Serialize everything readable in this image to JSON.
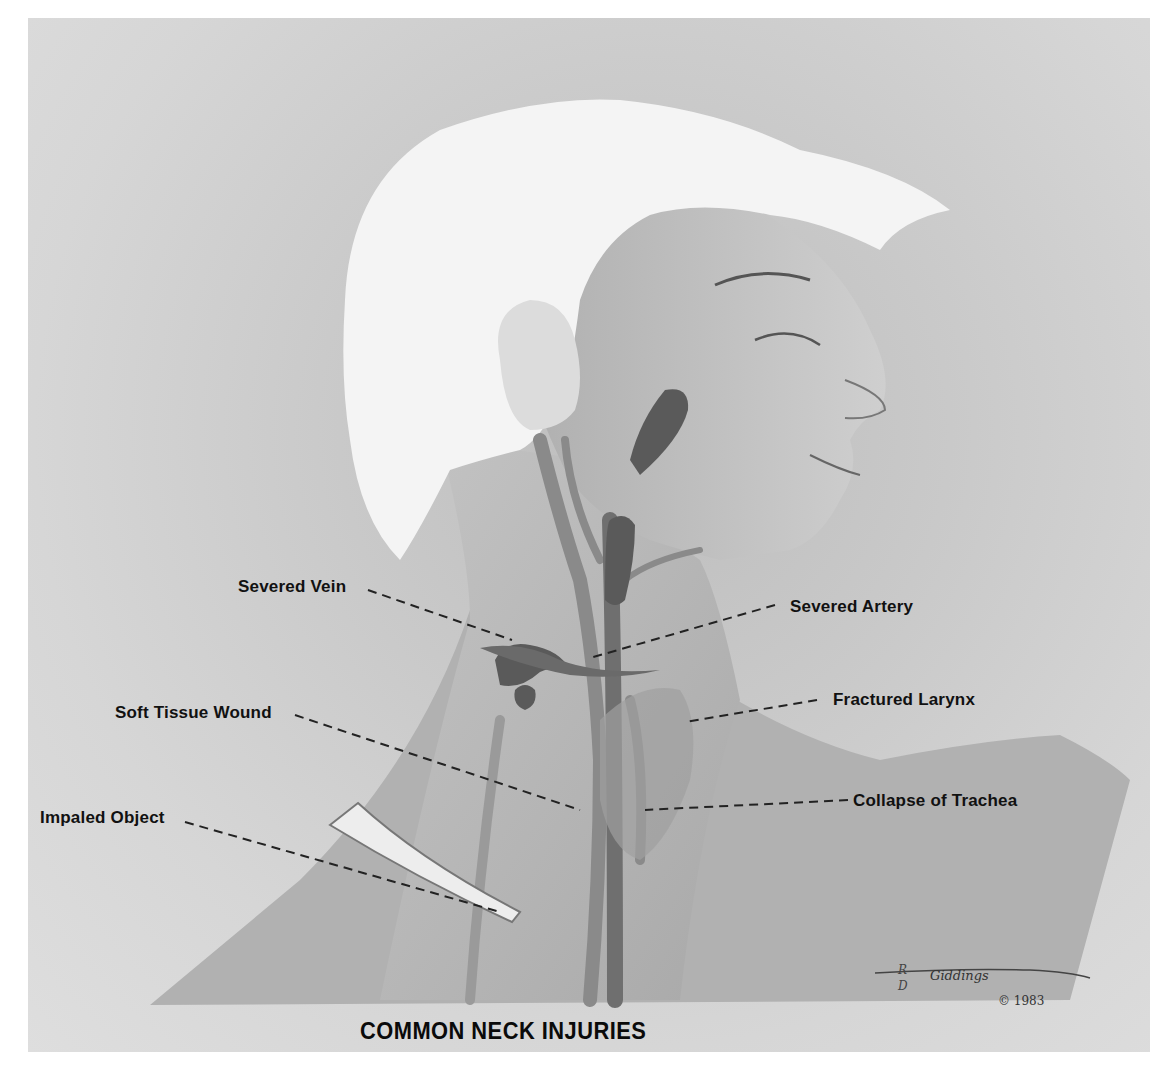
{
  "title": "COMMON NECK INJURIES",
  "labels": {
    "severed_vein": "Severed Vein",
    "severed_artery": "Severed Artery",
    "soft_tissue_wound": "Soft Tissue Wound",
    "fractured_larynx": "Fractured Larynx",
    "impaled_object": "Impaled Object",
    "collapse_of_trachea": "Collapse of Trachea"
  },
  "signature": {
    "artist": "Giddings",
    "initial_top": "R",
    "initial_bottom": "D",
    "copyright": "© 1983"
  },
  "colors": {
    "background_paper": "#d0d0d0",
    "skin": "#b8b8b8",
    "hair": "#f2f2f2",
    "blood": "#5a5a5a",
    "vessel": "#8e8e8e",
    "label_text": "#111111",
    "leader_line": "#222222"
  }
}
